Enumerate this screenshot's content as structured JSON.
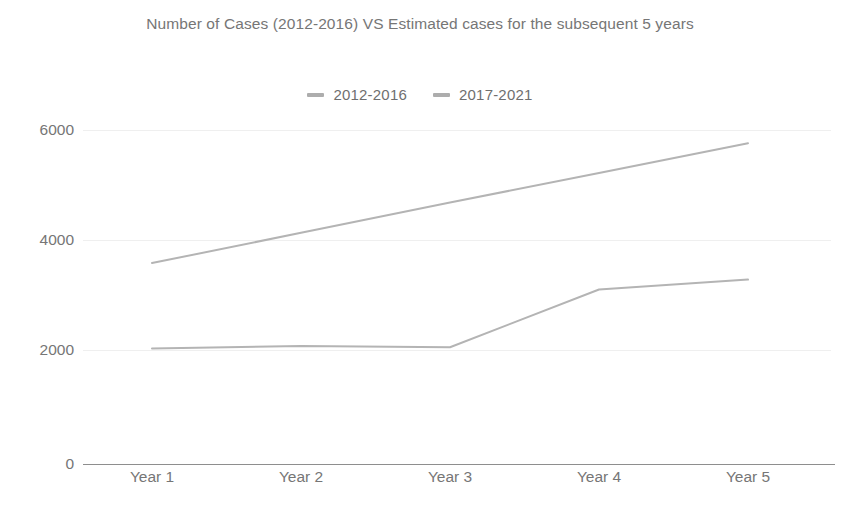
{
  "chart_data": {
    "type": "line",
    "title": "Number of Cases (2012-2016) VS Estimated cases for the subsequent 5 years",
    "title_line1": "Number of Cases (2012-2016) VS Estimated cases for the",
    "title_line2": "subsequent 5 years",
    "xlabel": "",
    "ylabel": "",
    "categories": [
      "Year 1",
      "Year 2",
      "Year 3",
      "Year 4",
      "Year 5"
    ],
    "ytick_labels": [
      "6000",
      "4000",
      "2000",
      "0"
    ],
    "yticks": [
      6000,
      4000,
      2000,
      0
    ],
    "ylim": [
      0,
      6200
    ],
    "grid": true,
    "legend_position": "top-center",
    "series": [
      {
        "name": "2012-2016",
        "color": "#b4b4b4",
        "marker": "dash",
        "values": [
          3580,
          4130,
          4680,
          5220,
          5760
        ]
      },
      {
        "name": "2017-2021",
        "color": "#b4b4b4",
        "marker": "dash",
        "values": [
          2030,
          2070,
          2050,
          3100,
          3280
        ]
      }
    ]
  },
  "legend": {
    "entries": [
      {
        "label": "2012-2016"
      },
      {
        "label": "2017-2021"
      }
    ]
  },
  "axes": {
    "y_labels": [
      "6000",
      "4000",
      "2000",
      "0"
    ],
    "x_labels": [
      "Year 1",
      "Year 2",
      "Year 3",
      "Year 4",
      "Year 5"
    ]
  }
}
